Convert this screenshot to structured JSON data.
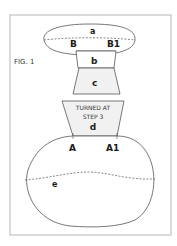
{
  "figure": {
    "title": "FIG. 1",
    "colors": {
      "frame": "#b5b5b5",
      "outline": "#555555",
      "shape_fill": "#f1f1f1",
      "text": "#1a1a1a"
    }
  },
  "pieces": {
    "a": {
      "label": "a",
      "left_mark": "B",
      "right_mark": "B1"
    },
    "b": {
      "label": "b"
    },
    "c": {
      "label": "c"
    },
    "d": {
      "label": "d",
      "note_line1": "TURNED AT",
      "note_line2": "STEP 3"
    },
    "e": {
      "label": "e",
      "left_mark": "A",
      "right_mark": "A1"
    }
  }
}
